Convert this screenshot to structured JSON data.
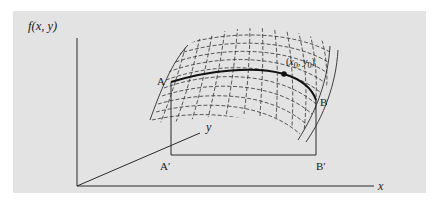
{
  "figure": {
    "type": "3d-surface-path-diagram",
    "axes": {
      "vertical_label": "f(x, y)",
      "x_label": "x",
      "y_label": "y"
    },
    "points": {
      "A": "A",
      "B": "B",
      "A_prime": "A′",
      "B_prime": "B′",
      "point": "(x0, y0)",
      "point_x": "x",
      "point_x_sub": "0",
      "point_sep": ", ",
      "point_y": "y",
      "point_y_sub": "0"
    },
    "colors": {
      "panel": "#e3e3e3",
      "ink": "#1a1a1a",
      "background": "#ffffff"
    }
  }
}
